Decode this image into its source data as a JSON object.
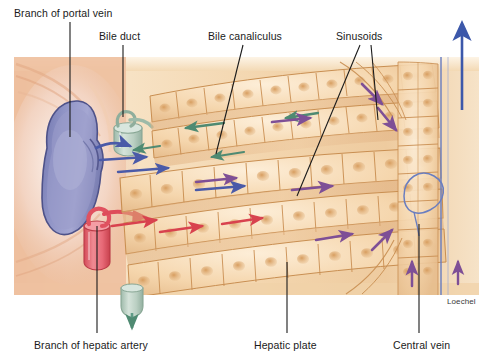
{
  "figure": {
    "signature": "Loechel",
    "frame": {
      "x": 14,
      "y": 57,
      "width": 465,
      "height": 238
    },
    "background_colors": {
      "page": "#ffffff",
      "tissue_tan": "#e9c69a",
      "cell_fill": "#f3d3ab",
      "cell_highlight": "#fae4c6",
      "cell_outline": "#c98f52",
      "nucleus": "#d9a566",
      "connective_peach": "#eec0a0",
      "portal_vein_blue": "#8a8ec2",
      "portal_vein_dark": "#5c5f96",
      "hepatic_artery_red": "#e8707c",
      "hepatic_artery_dark": "#c8454f",
      "bile_duct_green": "#bed0c4",
      "bile_duct_dark": "#8fae9c",
      "central_vein_blue": "#6a7ec0"
    },
    "arrow_colors": {
      "portal_blood_blue": "#4a5aa8",
      "arterial_blood_red": "#d8424e",
      "bile_green": "#4f8a72",
      "sinusoid_purple": "#7e4f96",
      "central_vein_blue": "#3c58aa"
    }
  },
  "labels": [
    {
      "id": "branch-of-portal-vein",
      "text": "Branch of portal vein",
      "leader": {
        "x1": 70,
        "y1": 22,
        "x2": 70,
        "y2": 137
      }
    },
    {
      "id": "bile-duct",
      "text": "Bile duct",
      "leader": {
        "x1": 123,
        "y1": 45,
        "x2": 123,
        "y2": 117
      }
    },
    {
      "id": "bile-canaliculus",
      "text": "Bile canaliculus",
      "leader": {
        "x1": 243,
        "y1": 45,
        "x2": 216,
        "y2": 154
      }
    },
    {
      "id": "sinusoids",
      "text": "Sinusoids",
      "leader": {
        "x1": 360,
        "y1": 45,
        "x2": 297,
        "y2": 196
      }
    },
    {
      "id": "branch-of-hepatic-artery",
      "text": "Branch of hepatic artery",
      "leader": {
        "x1": 97,
        "y1": 333,
        "x2": 97,
        "y2": 226
      }
    },
    {
      "id": "hepatic-plate",
      "text": "Hepatic plate",
      "leader": {
        "x1": 287,
        "y1": 333,
        "x2": 287,
        "y2": 262
      }
    },
    {
      "id": "central-vein",
      "text": "Central vein",
      "leader": {
        "x1": 419,
        "y1": 333,
        "x2": 419,
        "y2": 224
      }
    }
  ],
  "structures": [
    {
      "id": "portal-vein",
      "name": "Branch of portal vein",
      "color": "#8a8ec2",
      "shape": "large blue-violet vein lumen, left side"
    },
    {
      "id": "bile-duct-upper",
      "name": "Bile duct",
      "color": "#bed0c4",
      "shape": "pale green cylinder with curled hook, upper left"
    },
    {
      "id": "bile-duct-lower",
      "name": "Bile duct outflow",
      "color": "#bed0c4",
      "shape": "pale green cylinder with downward arrow, bottom left"
    },
    {
      "id": "hepatic-artery",
      "name": "Branch of hepatic artery",
      "color": "#e8707c",
      "shape": "pink-red cylinder with curling red arrow"
    },
    {
      "id": "central-vein",
      "name": "Central vein",
      "color": "#6a7ec0",
      "shape": "thin blue outlined vessel curving at right"
    },
    {
      "id": "hepatic-plates",
      "name": "Hepatic plates",
      "color": "#f3d3ab",
      "shape": "radiating rows of hepatocytes"
    },
    {
      "id": "sinusoids",
      "name": "Sinusoids",
      "color": "#e2b88b",
      "shape": "channels between hepatic plates"
    },
    {
      "id": "bile-canaliculi",
      "name": "Bile canaliculi",
      "color": "#c98f52",
      "shape": "fine channels between hepatocytes"
    }
  ],
  "flow_arrows": [
    {
      "id": "portal-inflow-1",
      "type": "portal_blood",
      "color": "#4a5aa8",
      "direction": "right"
    },
    {
      "id": "portal-inflow-2",
      "type": "portal_blood",
      "color": "#4a5aa8",
      "direction": "right"
    },
    {
      "id": "portal-inflow-3",
      "type": "portal_blood",
      "color": "#4a5aa8",
      "direction": "right"
    },
    {
      "id": "arterial-inflow-1",
      "type": "arterial_blood",
      "color": "#d8424e",
      "direction": "right"
    },
    {
      "id": "arterial-inflow-2",
      "type": "arterial_blood",
      "color": "#d8424e",
      "direction": "right"
    },
    {
      "id": "bile-flow-1",
      "type": "bile",
      "color": "#4f8a72",
      "direction": "left"
    },
    {
      "id": "bile-flow-2",
      "type": "bile",
      "color": "#4f8a72",
      "direction": "left"
    },
    {
      "id": "sinusoid-flow-1",
      "type": "sinusoid_blood",
      "color": "#7e4f96",
      "direction": "right"
    },
    {
      "id": "sinusoid-flow-2",
      "type": "sinusoid_blood",
      "color": "#7e4f96",
      "direction": "right"
    },
    {
      "id": "central-outflow",
      "type": "central_vein_blood",
      "color": "#3c58aa",
      "direction": "up"
    }
  ]
}
